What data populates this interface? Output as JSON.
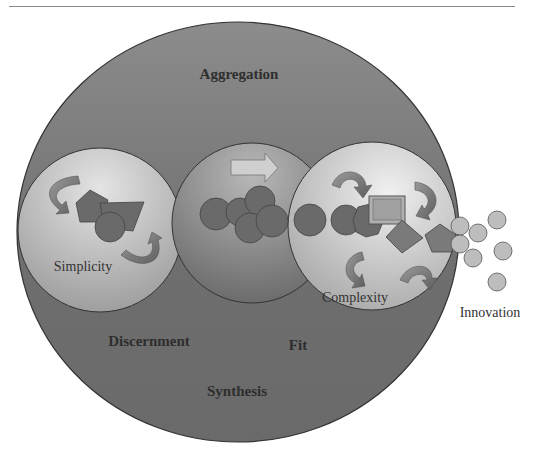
{
  "diagram": {
    "outer_labels": {
      "top": "Aggregation",
      "left": "Discernment",
      "center": "Fit",
      "bottom": "Synthesis"
    },
    "inner_circles": [
      {
        "id": "simplicity",
        "label": "Simplicity"
      },
      {
        "id": "middle",
        "label": ""
      },
      {
        "id": "complexity",
        "label": "Complexity"
      }
    ],
    "output_label": "Innovation",
    "colors": {
      "outer_circle": "#6f6f6f",
      "outer_circle_edge": "#3a3a3a",
      "inner_light": "#cfcfcf",
      "inner_mid": "#8f8f8f",
      "shape_fill": "#6a6a6a",
      "innovation_dots": "#bdbdbd"
    }
  }
}
